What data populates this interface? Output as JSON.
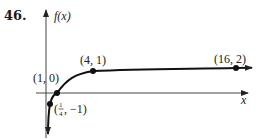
{
  "problem_number": "46.",
  "chart_data": {
    "type": "line",
    "function": "log base 4 of x",
    "title": "",
    "xlabel": "x",
    "ylabel": "f(x)",
    "grid": false,
    "legend": "none",
    "points": [
      {
        "x": 0.25,
        "y": -1,
        "label": "(1/4, -1)"
      },
      {
        "x": 1,
        "y": 0,
        "label": "(1, 0)"
      },
      {
        "x": 4,
        "y": 1,
        "label": "(4, 1)"
      },
      {
        "x": 16,
        "y": 2,
        "label": "(16, 2)"
      }
    ],
    "labels": {
      "p1": "(1, 0)",
      "p2": "(4, 1)",
      "p3": "(16, 2)",
      "p0_open": "(",
      "p0_num": "1",
      "p0_den": "4",
      "p0_rest": ", −1)"
    },
    "asymptote": "vertical at x = 0 (curve continues downward)",
    "curve_extends_right": true
  }
}
